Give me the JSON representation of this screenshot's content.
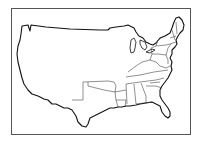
{
  "map": {
    "title": "",
    "description": "Outline map of the contiguous United States with eastern and southern state borders drawn; western region shown as a single undivided area",
    "colors": {
      "background": "#ffffff",
      "outline": "#111111",
      "frame": "#555555"
    },
    "regions_with_borders": [
      "Texas",
      "Oklahoma",
      "Arkansas",
      "Louisiana",
      "Mississippi",
      "Alabama",
      "Georgia",
      "Florida",
      "South Carolina",
      "North Carolina",
      "Tennessee",
      "Kentucky",
      "Virginia",
      "West Virginia",
      "Maryland",
      "Delaware",
      "New Jersey",
      "Pennsylvania",
      "New York",
      "Connecticut",
      "Rhode Island",
      "Massachusetts",
      "Vermont",
      "New Hampshire",
      "Maine",
      "Ohio"
    ],
    "undivided_region": "Western and northern interior"
  }
}
